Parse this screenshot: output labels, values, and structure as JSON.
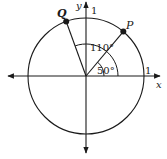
{
  "diagram": {
    "type": "unit-circle",
    "labels": {
      "x_axis": "x",
      "y_axis": "y",
      "x_intercept": "1",
      "y_intercept": "1",
      "point_q": "Q",
      "point_p": "P",
      "angle_large": "110°",
      "angle_small": "50°"
    },
    "angles_deg": {
      "P": 50,
      "Q": 110
    },
    "colors": {
      "stroke": "#1a1a1a",
      "background": "#ffffff"
    }
  }
}
